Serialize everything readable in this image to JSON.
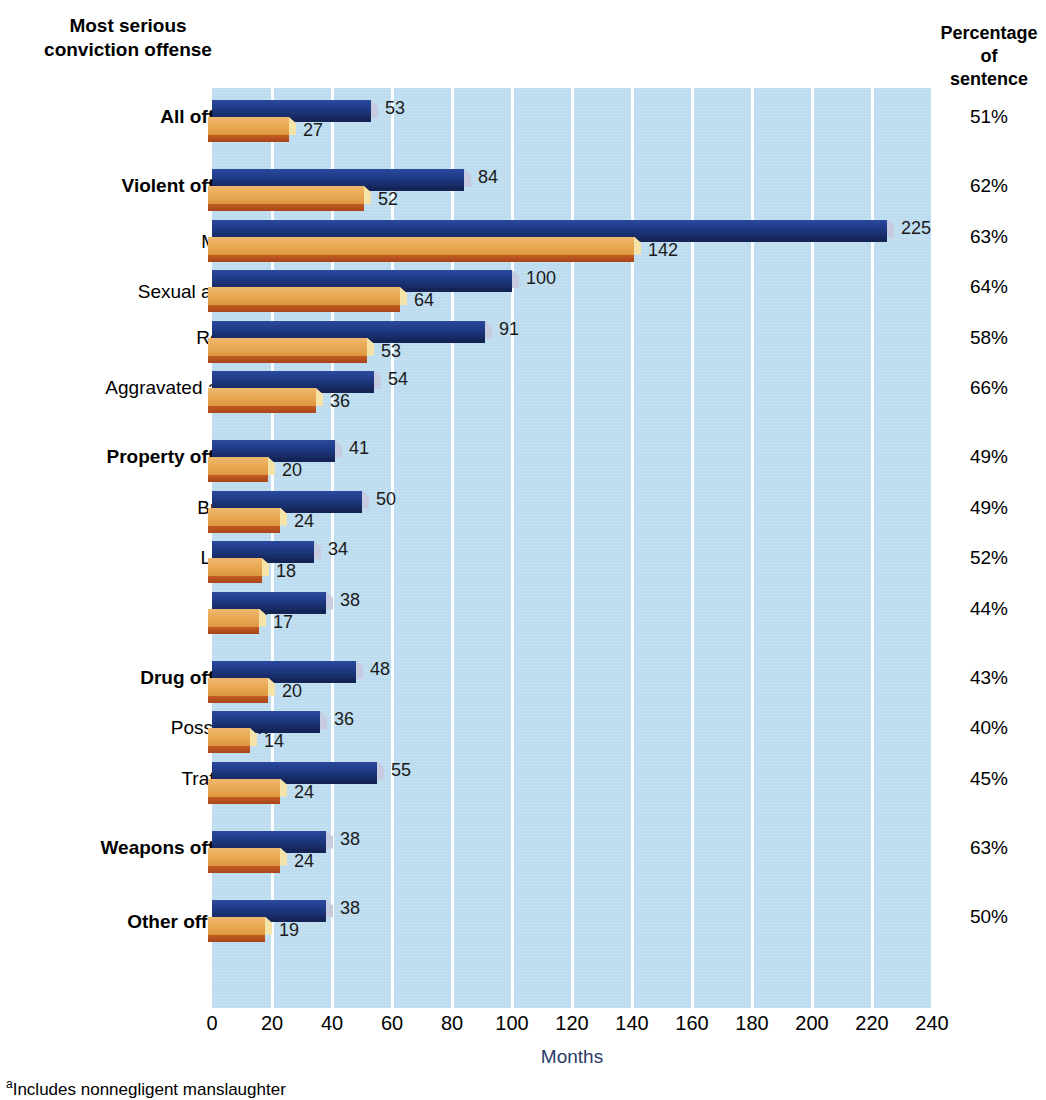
{
  "headers": {
    "left": "Most serious conviction offense",
    "left_line1": "Most serious",
    "left_line2": "conviction offense",
    "right_line1": "Percentage",
    "right_line2": "of",
    "right_line3": "sentence"
  },
  "axis": {
    "title": "Months",
    "ticks": [
      "0",
      "20",
      "40",
      "60",
      "80",
      "100",
      "120",
      "140",
      "160",
      "180",
      "200",
      "220",
      "240"
    ]
  },
  "footnote": {
    "marker": "a",
    "text": "Includes nonnegligent manslaughter"
  },
  "colors": {
    "blue": "#1f3a87",
    "orange": "#e8a752",
    "plot_background": "#bddcef",
    "gridline": "#ffffff"
  },
  "chart_data": {
    "type": "bar",
    "title": "Most serious conviction offense",
    "xlabel": "Months",
    "ylabel": "",
    "xlim": [
      0,
      240
    ],
    "grid": true,
    "orientation": "horizontal",
    "legend": [],
    "categories": [
      "All offenses",
      "Violent offenses",
      "Murder",
      "Sexual assault",
      "Robbery",
      "Aggravated assault",
      "Property offenses",
      "Burglary",
      "Larceny",
      "Fraud",
      "Drug offenses",
      "Possession",
      "Trafficking",
      "Weapons offenses",
      "Other offenses"
    ],
    "series": [
      {
        "name": "Sentence length",
        "values": [
          53,
          84,
          225,
          100,
          91,
          54,
          41,
          50,
          34,
          38,
          48,
          36,
          55,
          38,
          38
        ]
      },
      {
        "name": "Time served",
        "values": [
          27,
          52,
          142,
          64,
          53,
          36,
          20,
          24,
          18,
          17,
          20,
          14,
          24,
          24,
          19
        ]
      }
    ],
    "percent_of_sentence": [
      "51%",
      "62%",
      "63%",
      "64%",
      "58%",
      "66%",
      "49%",
      "49%",
      "52%",
      "44%",
      "43%",
      "40%",
      "45%",
      "63%",
      "50%"
    ]
  },
  "rows": [
    {
      "label": "All offenses",
      "sup": "",
      "bold": true,
      "blue": 53,
      "orange": 27,
      "pct": "51%",
      "group_gap": false
    },
    {
      "label": "Violent offenses",
      "sup": "",
      "bold": true,
      "blue": 84,
      "orange": 52,
      "pct": "62%",
      "group_gap": true
    },
    {
      "label": "Murder",
      "sup": "a",
      "bold": false,
      "blue": 225,
      "orange": 142,
      "pct": "63%",
      "group_gap": false
    },
    {
      "label": "Sexual assault",
      "sup": "b",
      "bold": false,
      "blue": 100,
      "orange": 64,
      "pct": "64%",
      "group_gap": false
    },
    {
      "label": "Robbery",
      "sup": "",
      "bold": false,
      "blue": 91,
      "orange": 53,
      "pct": "58%",
      "group_gap": false
    },
    {
      "label": "Aggravated assault",
      "sup": "",
      "bold": false,
      "blue": 54,
      "orange": 36,
      "pct": "66%",
      "group_gap": false
    },
    {
      "label": "Property offenses",
      "sup": "",
      "bold": true,
      "blue": 41,
      "orange": 20,
      "pct": "49%",
      "group_gap": true
    },
    {
      "label": "Burglary",
      "sup": "",
      "bold": false,
      "blue": 50,
      "orange": 24,
      "pct": "49%",
      "group_gap": false
    },
    {
      "label": "Larceny",
      "sup": "",
      "bold": false,
      "blue": 34,
      "orange": 18,
      "pct": "52%",
      "group_gap": false
    },
    {
      "label": "Fraud",
      "sup": "",
      "bold": false,
      "blue": 38,
      "orange": 17,
      "pct": "44%",
      "group_gap": false
    },
    {
      "label": "Drug offenses",
      "sup": "",
      "bold": true,
      "blue": 48,
      "orange": 20,
      "pct": "43%",
      "group_gap": true
    },
    {
      "label": "Possession",
      "sup": "",
      "bold": false,
      "blue": 36,
      "orange": 14,
      "pct": "40%",
      "group_gap": false
    },
    {
      "label": "Trafficking",
      "sup": "",
      "bold": false,
      "blue": 55,
      "orange": 24,
      "pct": "45%",
      "group_gap": false
    },
    {
      "label": "Weapons offenses",
      "sup": "",
      "bold": true,
      "blue": 38,
      "orange": 24,
      "pct": "63%",
      "group_gap": true
    },
    {
      "label": "Other offenses",
      "sup": "c",
      "bold": true,
      "blue": 38,
      "orange": 19,
      "pct": "50%",
      "group_gap": true
    }
  ]
}
